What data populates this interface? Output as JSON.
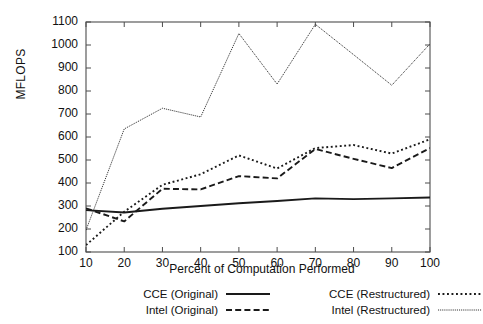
{
  "chart_data": {
    "type": "line",
    "title": "",
    "xlabel": "Percent of Computation Performed",
    "ylabel": "MFLOPS",
    "xlim": [
      10,
      100
    ],
    "ylim": [
      100,
      1100
    ],
    "grid": false,
    "legend_position": "bottom",
    "x": [
      10,
      20,
      30,
      40,
      50,
      60,
      70,
      80,
      90,
      100
    ],
    "xticks": [
      "10",
      "20",
      "30",
      "40",
      "50",
      "60",
      "70",
      "80",
      "90",
      "100"
    ],
    "yticks": [
      "100",
      "200",
      "300",
      "400",
      "500",
      "600",
      "700",
      "800",
      "900",
      "1000",
      "1100"
    ],
    "series": [
      {
        "name": "CCE (Original)",
        "style": "solid",
        "color": "#1a1a1a",
        "values": [
          282,
          272,
          288,
          300,
          312,
          322,
          333,
          330,
          333,
          337
        ]
      },
      {
        "name": "Intel (Original)",
        "style": "dashed",
        "color": "#1a1a1a",
        "values": [
          290,
          233,
          375,
          372,
          430,
          420,
          548,
          505,
          465,
          552
        ]
      },
      {
        "name": "CCE (Restructured)",
        "style": "dotted",
        "color": "#1a1a1a",
        "values": [
          130,
          275,
          392,
          438,
          520,
          463,
          552,
          565,
          528,
          590
        ]
      },
      {
        "name": "Intel (Restructured)",
        "style": "fine-dotted",
        "color": "#1a1a1a",
        "values": [
          195,
          635,
          725,
          687,
          1050,
          830,
          1090,
          958,
          825,
          1005
        ]
      }
    ]
  },
  "legend": {
    "entries": [
      {
        "label": "CCE (Original)",
        "style": "solid"
      },
      {
        "label": "Intel (Original)",
        "style": "dashed"
      },
      {
        "label": "CCE (Restructured)",
        "style": "dotted"
      },
      {
        "label": "Intel (Restructured)",
        "style": "fine-dotted"
      }
    ]
  }
}
